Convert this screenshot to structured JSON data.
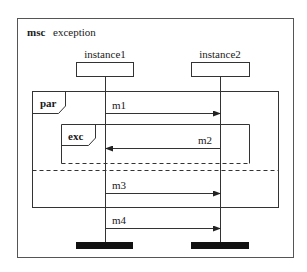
{
  "diagram": {
    "type": "msc",
    "keyword": "msc",
    "name": "exception",
    "instances": [
      {
        "id": "instance1",
        "label": "instance1"
      },
      {
        "id": "instance2",
        "label": "instance2"
      }
    ],
    "inline_expressions": [
      {
        "operator": "par",
        "sections": 2
      },
      {
        "operator": "exc"
      }
    ],
    "messages": [
      {
        "label": "m1",
        "from": "instance1",
        "to": "instance2"
      },
      {
        "label": "m2",
        "from": "instance2",
        "to": "instance1"
      },
      {
        "label": "m3",
        "from": "instance1",
        "to": "instance2"
      },
      {
        "label": "m4",
        "from": "instance1",
        "to": "instance2"
      }
    ],
    "colors": {
      "line": "#333333",
      "text": "#1a1a1a",
      "end_bar": "#111111",
      "background": "#ffffff"
    }
  }
}
